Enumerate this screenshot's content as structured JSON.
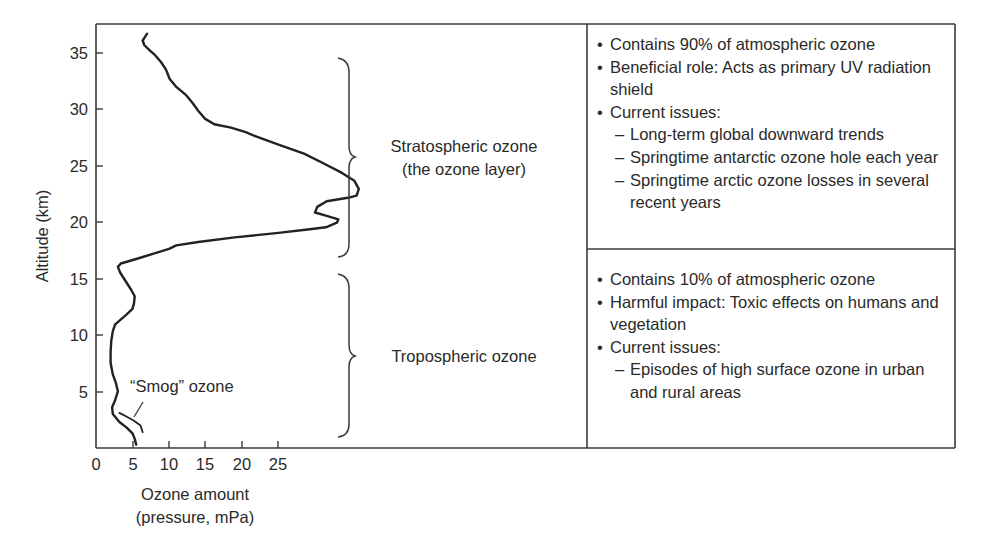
{
  "chart_data": {
    "type": "line",
    "title": "",
    "xlabel": "Ozone amount (pressure, mPa)",
    "xlabel_lines": [
      "Ozone amount",
      "(pressure, mPa)"
    ],
    "ylabel": "Altitude (km)",
    "xticks": [
      0,
      5,
      10,
      15,
      20,
      25
    ],
    "yticks": [
      5,
      10,
      15,
      20,
      25,
      30,
      35
    ],
    "xlim": [
      0,
      67
    ],
    "ylim": [
      0,
      37
    ],
    "grid": false,
    "legend": null,
    "series": [
      {
        "name": "Ozone profile",
        "points": [
          [
            5.5,
            0.3
          ],
          [
            5.3,
            0.8
          ],
          [
            5.0,
            1.3
          ],
          [
            4.2,
            1.8
          ],
          [
            3.2,
            2.3
          ],
          [
            2.3,
            3.0
          ],
          [
            2.2,
            3.6
          ],
          [
            2.6,
            4.2
          ],
          [
            3.0,
            5.0
          ],
          [
            2.7,
            5.8
          ],
          [
            2.3,
            6.5
          ],
          [
            2.0,
            7.5
          ],
          [
            2.0,
            8.5
          ],
          [
            2.1,
            9.5
          ],
          [
            2.3,
            10.3
          ],
          [
            2.6,
            10.9
          ],
          [
            3.3,
            11.3
          ],
          [
            4.2,
            11.8
          ],
          [
            5.0,
            12.3
          ],
          [
            5.2,
            12.8
          ],
          [
            5.3,
            13.4
          ],
          [
            4.8,
            14.0
          ],
          [
            4.0,
            14.8
          ],
          [
            3.3,
            15.5
          ],
          [
            3.0,
            16.0
          ],
          [
            3.4,
            16.3
          ],
          [
            5.5,
            16.7
          ],
          [
            8.0,
            17.2
          ],
          [
            10.0,
            17.6
          ],
          [
            11.0,
            17.9
          ],
          [
            14.0,
            18.2
          ],
          [
            19.0,
            18.6
          ],
          [
            25.0,
            19.0
          ],
          [
            29.0,
            19.3
          ],
          [
            31.5,
            19.5
          ],
          [
            33.0,
            19.9
          ],
          [
            33.2,
            20.2
          ],
          [
            31.6,
            20.5
          ],
          [
            30.0,
            20.8
          ],
          [
            30.3,
            21.3
          ],
          [
            31.6,
            21.8
          ],
          [
            34.5,
            22.1
          ],
          [
            35.7,
            22.3
          ],
          [
            36.0,
            22.9
          ],
          [
            35.4,
            23.6
          ],
          [
            33.7,
            24.3
          ],
          [
            31.0,
            25.2
          ],
          [
            28.5,
            26.0
          ],
          [
            25.0,
            26.8
          ],
          [
            22.0,
            27.5
          ],
          [
            20.5,
            27.9
          ],
          [
            18.5,
            28.3
          ],
          [
            16.2,
            28.6
          ],
          [
            14.9,
            29.1
          ],
          [
            14.0,
            29.8
          ],
          [
            13.2,
            30.5
          ],
          [
            12.3,
            31.2
          ],
          [
            11.0,
            31.9
          ],
          [
            10.1,
            32.6
          ],
          [
            9.6,
            33.4
          ],
          [
            8.9,
            34.1
          ],
          [
            8.1,
            34.7
          ],
          [
            7.4,
            35.1
          ],
          [
            6.6,
            35.6
          ],
          [
            6.4,
            36.0
          ],
          [
            7.0,
            36.6
          ]
        ]
      },
      {
        "name": "Smog ozone",
        "points": [
          [
            3.2,
            3.1
          ],
          [
            4.1,
            2.8
          ],
          [
            5.2,
            2.4
          ],
          [
            6.1,
            2.0
          ],
          [
            6.4,
            1.4
          ]
        ]
      }
    ],
    "annotations": [
      {
        "text": "“Smog” ozone",
        "x": 5,
        "y": 4.8
      },
      {
        "text": "Stratospheric ozone",
        "spans_altitude_km": [
          17,
          35.5
        ]
      },
      {
        "text": "(the ozone layer)",
        "spans_altitude_km": [
          17,
          35.5
        ]
      },
      {
        "text": "Tropospheric ozone",
        "spans_altitude_km": [
          0.8,
          15.5
        ]
      }
    ]
  },
  "axes": {
    "y_label": "Altitude (km)",
    "x_label_line1": "Ozone amount",
    "x_label_line2": "(pressure, mPa)",
    "x_ticks": [
      "0",
      "5",
      "10",
      "15",
      "20",
      "25"
    ],
    "y_ticks": [
      "5",
      "10",
      "15",
      "20",
      "25",
      "30",
      "35"
    ]
  },
  "annotations": {
    "smog": "“Smog” ozone",
    "strat_line1": "Stratospheric ozone",
    "strat_line2": "(the ozone layer)",
    "trop": "Tropospheric ozone"
  },
  "panels": {
    "stratospheric": {
      "items": [
        {
          "type": "bullet",
          "text": "Contains 90% of atmospheric ozone"
        },
        {
          "type": "bullet",
          "text": "Beneficial role: Acts as primary UV radiation shield"
        },
        {
          "type": "bullet",
          "text": "Current issues:"
        },
        {
          "type": "dash",
          "text": "Long-term global downward trends"
        },
        {
          "type": "dash",
          "text": "Springtime antarctic ozone hole each year"
        },
        {
          "type": "dash",
          "text": "Springtime arctic ozone losses in several recent years"
        }
      ]
    },
    "tropospheric": {
      "items": [
        {
          "type": "bullet",
          "text": "Contains 10% of atmospheric ozone"
        },
        {
          "type": "bullet",
          "text": "Harmful impact: Toxic effects on humans and vegetation"
        },
        {
          "type": "bullet",
          "text": "Current issues:"
        },
        {
          "type": "dash",
          "text": "Episodes of high surface ozone in urban and rural areas"
        }
      ]
    }
  },
  "colors": {
    "ink": "#2a2a2a",
    "frame": "#3a3a3a",
    "background": "#ffffff"
  }
}
